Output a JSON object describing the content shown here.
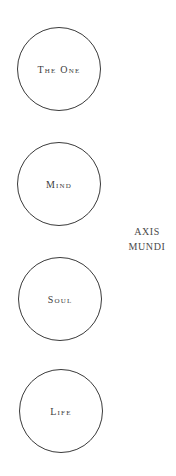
{
  "diagram": {
    "nodes": [
      {
        "label": "The One"
      },
      {
        "label": "Mind"
      },
      {
        "label": "Soul"
      },
      {
        "label": "Life"
      }
    ],
    "axis_label": {
      "line1": "AXIS",
      "line2": "MUNDI"
    }
  },
  "colors": {
    "stroke": "#3a3a3a",
    "text": "#3c3c3c",
    "background": "#ffffff"
  }
}
